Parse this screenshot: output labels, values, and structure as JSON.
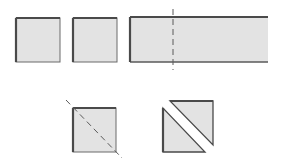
{
  "diagram": {
    "title": "",
    "colors": {
      "fill": "#e3e3e3",
      "edge_dark": "#4a4a4a",
      "edge_light": "#6a6a6a",
      "cut_line": "#5a5a5a",
      "background": "#ffffff"
    },
    "top_row": {
      "square_1": {
        "x": 16,
        "y": 18,
        "w": 44,
        "h": 44
      },
      "square_2": {
        "x": 73,
        "y": 18,
        "w": 44,
        "h": 44
      },
      "strip": {
        "x": 130,
        "y": 17,
        "w": 138,
        "h": 45
      },
      "strip_cut_line": {
        "x": 173,
        "y1": 9,
        "y2": 70,
        "style": "dashed"
      }
    },
    "bottom_row": {
      "square_with_diagonal": {
        "x": 73,
        "y": 108,
        "w": 43,
        "h": 44
      },
      "diagonal_cut_line": {
        "x1": 66,
        "y1": 100,
        "x2": 122,
        "y2": 158,
        "style": "dashed"
      },
      "triangle_lower_left": {
        "points": "163,108 163,152 205,152"
      },
      "triangle_upper_right": {
        "points": "170,101 213,101 213,145"
      }
    }
  }
}
